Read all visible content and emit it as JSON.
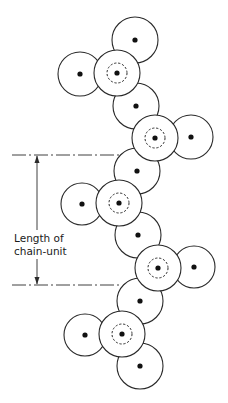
{
  "figure": {
    "label_line1": "Length of",
    "label_line2": "chain-unit",
    "stroke_color": "#2a2a2a",
    "background": "#ffffff"
  },
  "circles": [
    {
      "cx": 135,
      "cy": 40,
      "r": 23,
      "type": "pendant"
    },
    {
      "cx": 80,
      "cy": 74,
      "r": 22,
      "type": "pendant"
    },
    {
      "cx": 117,
      "cy": 73,
      "r": 23,
      "type": "backbone-branch"
    },
    {
      "cx": 136,
      "cy": 106,
      "r": 23,
      "type": "backbone"
    },
    {
      "cx": 191,
      "cy": 137,
      "r": 22,
      "type": "pendant"
    },
    {
      "cx": 155,
      "cy": 138,
      "r": 23,
      "type": "backbone-branch"
    },
    {
      "cx": 137,
      "cy": 171,
      "r": 23,
      "type": "backbone"
    },
    {
      "cx": 82,
      "cy": 204,
      "r": 21,
      "type": "pendant"
    },
    {
      "cx": 119,
      "cy": 203,
      "r": 23,
      "type": "backbone-branch"
    },
    {
      "cx": 138,
      "cy": 235,
      "r": 23,
      "type": "backbone"
    },
    {
      "cx": 194,
      "cy": 267,
      "r": 21,
      "type": "pendant"
    },
    {
      "cx": 158,
      "cy": 268,
      "r": 23,
      "type": "backbone-branch"
    },
    {
      "cx": 140,
      "cy": 301,
      "r": 23,
      "type": "backbone"
    },
    {
      "cx": 85,
      "cy": 335,
      "r": 21,
      "type": "pendant"
    },
    {
      "cx": 122,
      "cy": 334,
      "r": 23,
      "type": "backbone-branch"
    },
    {
      "cx": 140,
      "cy": 366,
      "r": 23,
      "type": "pendant"
    }
  ],
  "dimension": {
    "top_y": 155,
    "bottom_y": 285,
    "arrow_x": 37,
    "line_x_start": 12,
    "line_x_end": 120
  }
}
